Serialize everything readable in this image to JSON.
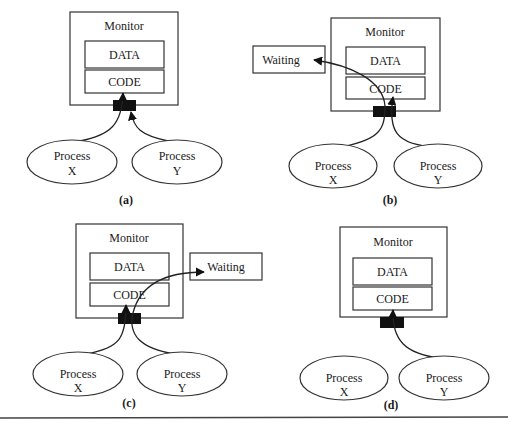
{
  "diagram": {
    "type": "monitor-mutual-exclusion",
    "colors": {
      "stroke": "#333333",
      "lock": "#111111",
      "background": "#ffffff"
    },
    "panels": [
      {
        "id": "a",
        "caption": "(a)",
        "monitor": {
          "title": "Monitor",
          "data_label": "DATA",
          "code_label": "CODE"
        },
        "processes": [
          {
            "line1": "Process",
            "line2": "X"
          },
          {
            "line1": "Process",
            "line2": "Y"
          }
        ],
        "description": "Process X and Process Y both request entry at the monitor gate; X enters CODE"
      },
      {
        "id": "b",
        "caption": "(b)",
        "monitor": {
          "title": "Monitor",
          "data_label": "DATA",
          "code_label": "CODE"
        },
        "waiting": {
          "label": "Waiting",
          "side": "left"
        },
        "processes": [
          {
            "line1": "Process",
            "line2": "X"
          },
          {
            "line1": "Process",
            "line2": "Y"
          }
        ],
        "description": "Process X goes to Waiting; Process Y enters CODE"
      },
      {
        "id": "c",
        "caption": "(c)",
        "monitor": {
          "title": "Monitor",
          "data_label": "DATA",
          "code_label": "CODE"
        },
        "waiting": {
          "label": "Waiting",
          "side": "right"
        },
        "processes": [
          {
            "line1": "Process",
            "line2": "X"
          },
          {
            "line1": "Process",
            "line2": "Y"
          }
        ],
        "description": "Process Y goes to Waiting; Process X enters CODE"
      },
      {
        "id": "d",
        "caption": "(d)",
        "monitor": {
          "title": "Monitor",
          "data_label": "DATA",
          "code_label": "CODE"
        },
        "processes": [
          {
            "line1": "Process",
            "line2": "X"
          },
          {
            "line1": "Process",
            "line2": "Y"
          }
        ],
        "description": "Only Process Y enters CODE"
      }
    ]
  }
}
